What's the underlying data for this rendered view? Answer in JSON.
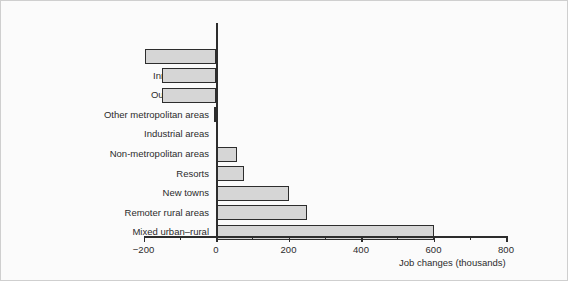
{
  "chart_data": {
    "type": "bar",
    "orientation": "horizontal",
    "title": "",
    "xlabel": "Job changes (thousands)",
    "ylabel": "",
    "xlim": [
      -280,
      800
    ],
    "xticks": [
      -200,
      0,
      200,
      400,
      600,
      800
    ],
    "xtick_labels": [
      "−200",
      "0",
      "200",
      "400",
      "600",
      "800"
    ],
    "xticks_minor": [
      -100,
      100,
      300,
      500,
      700
    ],
    "grid": false,
    "legend": false,
    "bar_fill_color": "#d6d6d6",
    "bar_edge_color": "#2d2d2d",
    "categories": [
      "Principal cities",
      "Inner London",
      "Outer London",
      "Other metropolitan areas",
      "Industrial areas",
      "Non-metropolitan areas",
      "Resorts",
      "New towns",
      "Remoter rural areas",
      "Mixed urban–rural"
    ],
    "values": [
      -195,
      -150,
      -150,
      -5,
      5,
      58,
      77,
      200,
      250,
      600
    ]
  },
  "figure": {
    "background_color": "#fbfbfb",
    "border_color": "#cfcfcf"
  }
}
